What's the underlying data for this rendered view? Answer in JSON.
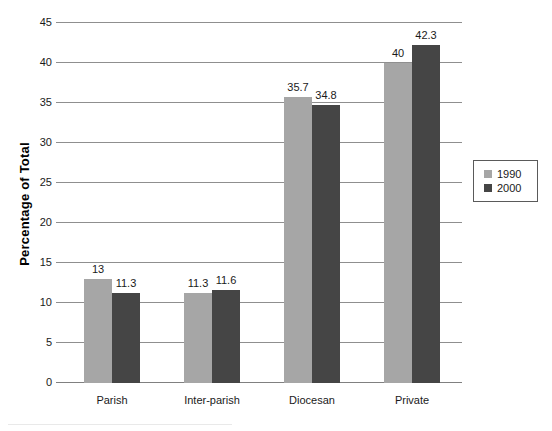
{
  "chart_data": {
    "type": "bar",
    "title": "",
    "xlabel": "",
    "ylabel": "Percentage of Total",
    "categories": [
      "Parish",
      "Inter-parish",
      "Diocesan",
      "Private"
    ],
    "series": [
      {
        "name": "1990",
        "color": "#a6a6a6",
        "values": [
          13,
          11.3,
          35.7,
          40
        ]
      },
      {
        "name": "2000",
        "color": "#454545",
        "values": [
          11.3,
          11.6,
          34.8,
          42.3
        ]
      }
    ],
    "value_labels": [
      [
        "13",
        "11.3"
      ],
      [
        "11.3",
        "11.6"
      ],
      [
        "35.7",
        "34.8"
      ],
      [
        "40",
        "42.3"
      ]
    ],
    "ylim": [
      0,
      45
    ],
    "ytick_step": 5,
    "ytick_labels": [
      "0",
      "5",
      "10",
      "15",
      "20",
      "25",
      "30",
      "35",
      "40",
      "45"
    ],
    "grid": true,
    "legend_position": "right",
    "legend_entries": [
      "1990",
      "2000"
    ]
  },
  "colors": {
    "background": "#ffffff",
    "gridline": "#8f8f8f",
    "axis_line": "#808080",
    "text": "#1a1a1a",
    "legend_border": "#5a5a5a"
  }
}
